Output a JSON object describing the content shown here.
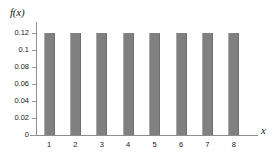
{
  "chart_data": {
    "type": "bar",
    "title": "",
    "subtitle": "",
    "xlabel": "x",
    "ylabel": "f(x)",
    "categories": [
      "1",
      "2",
      "3",
      "4",
      "5",
      "6",
      "7",
      "8"
    ],
    "values": [
      0.12,
      0.12,
      0.12,
      0.12,
      0.12,
      0.12,
      0.12,
      0.12
    ],
    "ylim": [
      0,
      0.13
    ],
    "xlim": [
      0.4,
      8.6
    ],
    "ytick_labels": [
      "0",
      "0.02",
      "0.04",
      "0.06",
      "0.08",
      "0.1",
      "0.12"
    ],
    "ytick_values": [
      0,
      0.02,
      0.04,
      0.06,
      0.08,
      0.1,
      0.12
    ],
    "xtick_labels": [
      "1",
      "2",
      "3",
      "4",
      "5",
      "6",
      "7",
      "8"
    ],
    "grid": false,
    "legend": null,
    "annotations": [],
    "colors": {
      "bar_fill": "#808080",
      "bar_edge_light": "#a9a9a9",
      "bar_edge_dark": "#6f6f6f",
      "axis": "#8c8c8c",
      "text": "#1a1a1a",
      "background": "#ffffff"
    }
  }
}
